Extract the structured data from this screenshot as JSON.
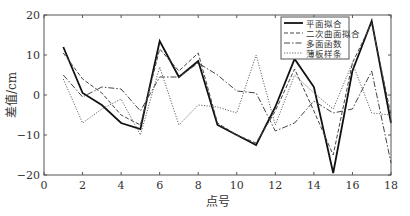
{
  "chart_data": {
    "type": "line",
    "title": "",
    "xlabel": "点号",
    "ylabel": "差值/cm",
    "xlim": [
      0,
      18
    ],
    "ylim": [
      -20,
      20
    ],
    "xticks": [
      0,
      2,
      4,
      6,
      8,
      10,
      12,
      14,
      16,
      18
    ],
    "yticks": [
      -20,
      -10,
      0,
      10,
      20
    ],
    "grid": false,
    "legend_position": "upper-right",
    "x": [
      1,
      2,
      3,
      4,
      5,
      6,
      7,
      8,
      9,
      10,
      11,
      12,
      13,
      14,
      15,
      16,
      17,
      18
    ],
    "series": [
      {
        "name": "平面拟合",
        "style": "solid",
        "color": "#111111",
        "width": 1.8,
        "values": [
          12,
          0.5,
          -2.5,
          -7,
          -8.5,
          13.5,
          4.5,
          8.5,
          -7.5,
          -10,
          -12.5,
          -3,
          9,
          2,
          -19.5,
          6,
          18.5,
          -7
        ]
      },
      {
        "name": "二次曲面拟合",
        "style": "dashed",
        "color": "#444444",
        "width": 1,
        "values": [
          10.5,
          4,
          0.5,
          -5,
          -7.5,
          11.5,
          6,
          10.5,
          -7,
          -10,
          -12,
          -4,
          6.5,
          -4,
          -15,
          8,
          18,
          -5
        ]
      },
      {
        "name": "多面函数",
        "style": "dashdot",
        "color": "#444444",
        "width": 1,
        "values": [
          5,
          -0.5,
          2,
          1.5,
          -4,
          4.5,
          4.5,
          8,
          5,
          1,
          0.5,
          -9,
          -7,
          -1.5,
          -4.5,
          -3.5,
          6,
          -17
        ]
      },
      {
        "name": "薄板样条",
        "style": "dotted",
        "color": "#666666",
        "width": 1,
        "values": [
          4,
          -7,
          -3.5,
          -1,
          -10,
          7,
          -7.5,
          -2.5,
          -3,
          -4.5,
          10,
          -7.5,
          5,
          0.5,
          -3.5,
          8,
          -4.5,
          -5
        ]
      }
    ]
  },
  "labels": {
    "xlabel": "点号",
    "ylabel": "差值/cm",
    "legend": [
      "平面拟合",
      "二次曲面拟合",
      "多面函数",
      "薄板样条"
    ]
  }
}
